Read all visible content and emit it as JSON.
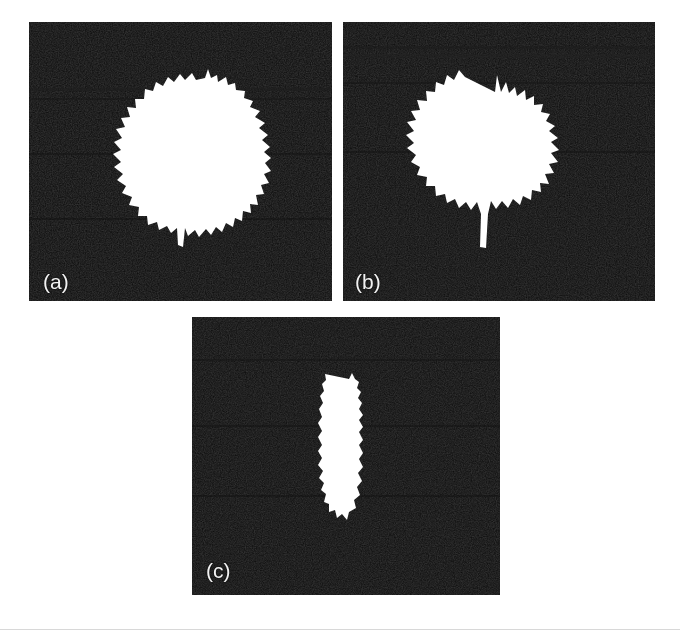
{
  "figure": {
    "background_color": "#ffffff",
    "panel_background_color": "#0d0d0d",
    "object_color": "#ffffff",
    "label_color": "#f2f2f2",
    "panel_count": 3,
    "layout": "two panels on top row, one centered panel on bottom row",
    "bottom_rule_color": "#d8d8d8"
  },
  "panels": [
    {
      "id": "a",
      "label": "(a)",
      "label_position": "bottom-left",
      "rect": {
        "x": 29,
        "y": 22,
        "width": 303,
        "height": 279
      },
      "object": {
        "name": "spiky-round-blob-large",
        "description": "large bright irregular roughly circular object with dendritic spikes around its perimeter and a downward tail",
        "center_x": 180,
        "center_y": 135,
        "width": 145,
        "height": 160
      }
    },
    {
      "id": "b",
      "label": "(b)",
      "label_position": "bottom-left",
      "rect": {
        "x": 343,
        "y": 22,
        "width": 312,
        "height": 279
      },
      "object": {
        "name": "spiky-round-blob-medium",
        "description": "medium bright irregular roughly circular object with pronounced radial spikes and a long downward tail",
        "center_x": 493,
        "center_y": 168,
        "width": 120,
        "height": 145
      }
    },
    {
      "id": "c",
      "label": "(c)",
      "label_position": "bottom-left",
      "rect": {
        "x": 192,
        "y": 317,
        "width": 308,
        "height": 278
      },
      "object": {
        "name": "elongated-vertical-blob-small",
        "description": "small bright vertically elongated spindle-shaped object with ragged edges",
        "center_x": 349,
        "center_y": 437,
        "width": 30,
        "height": 120
      }
    }
  ]
}
